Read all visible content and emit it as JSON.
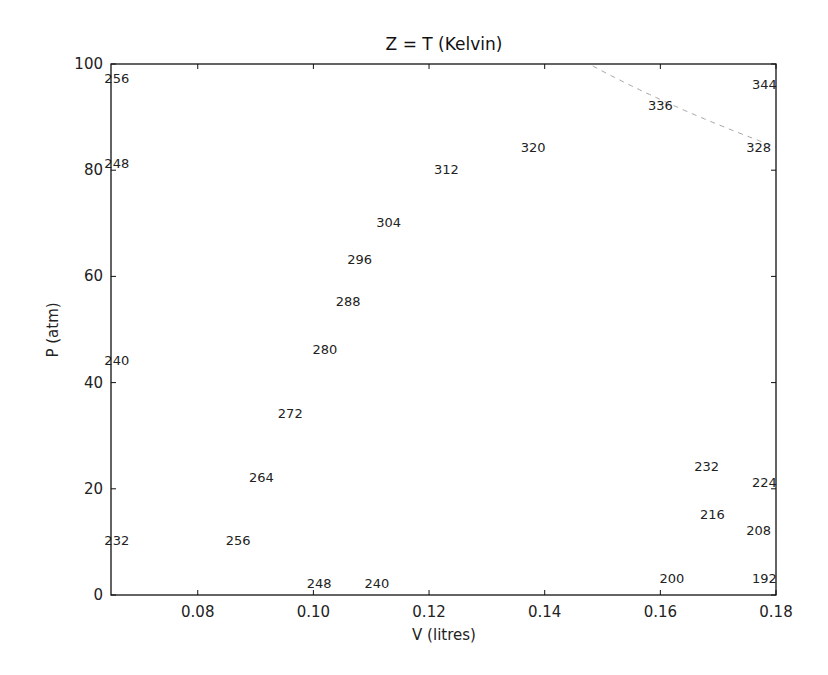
{
  "chart_data": {
    "type": "contour",
    "title": "Z = T (Kelvin)",
    "xlabel": "V (litres)",
    "ylabel": "P (atm)",
    "xlim": [
      0.065,
      0.18
    ],
    "ylim": [
      0,
      100
    ],
    "xticks": [
      0.08,
      0.1,
      0.12,
      0.14,
      0.16,
      0.18
    ],
    "xtick_labels": [
      "0.08",
      "0.10",
      "0.12",
      "0.14",
      "0.16",
      "0.18"
    ],
    "yticks": [
      0,
      20,
      40,
      60,
      80,
      100
    ],
    "ytick_labels": [
      "0",
      "20",
      "40",
      "60",
      "80",
      "100"
    ],
    "grid": false,
    "legend": null,
    "levels": [
      192,
      200,
      208,
      216,
      224,
      232,
      240,
      248,
      256,
      264,
      272,
      280,
      288,
      296,
      304,
      312,
      320,
      328,
      336,
      344
    ],
    "level_step": 8,
    "line_styles": {
      "solid_min_level": 256,
      "dashed_max_level": 248,
      "solid_color": "#1a1a1a",
      "dashed_color": "#9a9a9a"
    },
    "visible_contour_labels": [
      {
        "text": "256",
        "near": [
          0.066,
          97
        ]
      },
      {
        "text": "248",
        "near": [
          0.066,
          81
        ]
      },
      {
        "text": "240",
        "near": [
          0.066,
          44
        ]
      },
      {
        "text": "232",
        "near": [
          0.066,
          10
        ]
      },
      {
        "text": "344",
        "near": [
          0.178,
          96
        ],
        "note": "clipped as '34'"
      },
      {
        "text": "336",
        "near": [
          0.16,
          92
        ]
      },
      {
        "text": "328",
        "near": [
          0.177,
          84
        ]
      },
      {
        "text": "320",
        "near": [
          0.138,
          84
        ]
      },
      {
        "text": "312",
        "near": [
          0.123,
          80
        ]
      },
      {
        "text": "304",
        "near": [
          0.113,
          70
        ]
      },
      {
        "text": "296",
        "near": [
          0.108,
          63
        ]
      },
      {
        "text": "288",
        "near": [
          0.106,
          55
        ]
      },
      {
        "text": "280",
        "near": [
          0.102,
          46
        ]
      },
      {
        "text": "272",
        "near": [
          0.096,
          34
        ]
      },
      {
        "text": "264",
        "near": [
          0.091,
          22
        ]
      },
      {
        "text": "256",
        "near": [
          0.087,
          10
        ]
      },
      {
        "text": "248",
        "near": [
          0.101,
          2
        ]
      },
      {
        "text": "240",
        "near": [
          0.111,
          2
        ]
      },
      {
        "text": "232",
        "near": [
          0.168,
          24
        ]
      },
      {
        "text": "224",
        "near": [
          0.178,
          21
        ]
      },
      {
        "text": "216",
        "near": [
          0.169,
          15
        ]
      },
      {
        "text": "208",
        "near": [
          0.177,
          12
        ]
      },
      {
        "text": "200",
        "near": [
          0.162,
          3
        ]
      },
      {
        "text": "192",
        "near": [
          0.178,
          3
        ],
        "note": "clipped as '19'"
      }
    ]
  }
}
